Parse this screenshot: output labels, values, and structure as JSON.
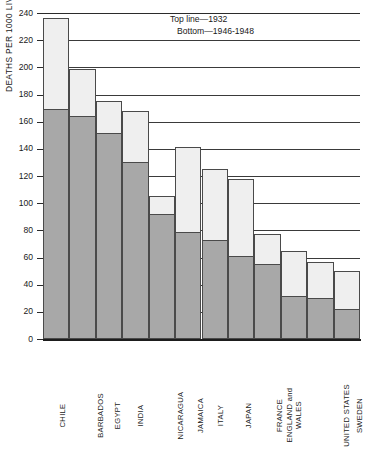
{
  "chart_data": {
    "type": "bar",
    "title": "",
    "subtitle": "",
    "xlabel": "",
    "ylabel": "DEATHS PER 1000 LIVE BIRTHS",
    "ylim": [
      0,
      240
    ],
    "ytick_step": 20,
    "yticks": [
      0,
      20,
      40,
      60,
      80,
      100,
      120,
      140,
      160,
      180,
      200,
      220,
      240
    ],
    "grid": true,
    "legend_position": "top-right-inside",
    "annotations": [
      "Top line—1932",
      "Bottom—1946-1948"
    ],
    "categories": [
      "CHILE",
      "BARBADOS",
      "EGYPT",
      "INDIA",
      "NICARAGUA",
      "JAMAICA",
      "ITALY",
      "JAPAN",
      "FRANCE",
      "ENGLAND and WALES",
      "UNITED STATES",
      "SWEDEN"
    ],
    "series": [
      {
        "name": "Top line—1932",
        "values": [
          236,
          199,
          175,
          168,
          105,
          141,
          125,
          118,
          77,
          65,
          57,
          50
        ]
      },
      {
        "name": "Bottom—1946-1948",
        "values": [
          169,
          164,
          152,
          130,
          92,
          79,
          73,
          61,
          55,
          32,
          30,
          22
        ]
      }
    ],
    "colors": {
      "upper_fill": "#efefef",
      "lower_fill": "#a8a8a8",
      "outline": "#4a4a4a",
      "axis": "#1d1d1d",
      "grid": "#3a3a3a",
      "text": "#1a1a1a"
    }
  },
  "axis": {
    "y_title": "DEATHS PER 1000 LIVE BIRTHS"
  },
  "legend": {
    "line1": "Top line—1932",
    "line2": "Bottom—1946-1948"
  }
}
